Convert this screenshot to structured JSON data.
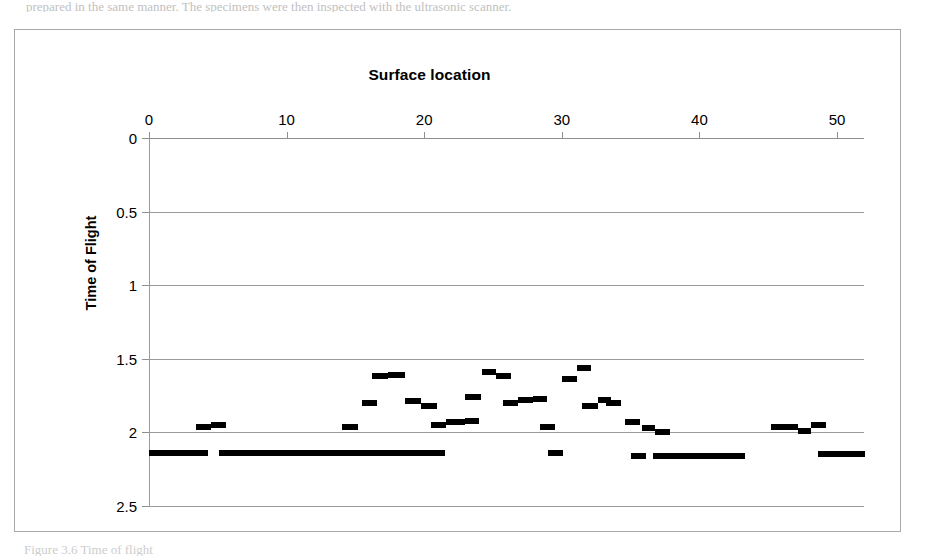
{
  "page": {
    "top_text_sliver": "prepared in the same manner. The specimens were then inspected with the ultrasonic scanner.",
    "bottom_text_sliver": "Figure 3.6  Time of flight"
  },
  "figure": {
    "title": "Surface location",
    "y_axis_title": "Time of Flight",
    "frame_color": "#a9a9a9",
    "grid_color": "#9b9b9b",
    "marker_color": "#000000"
  },
  "chart_data": {
    "type": "scatter",
    "title": "Surface location",
    "xlabel": "Surface location",
    "ylabel": "Time of Flight",
    "xlim": [
      -1,
      52
    ],
    "ylim": [
      0,
      2.5
    ],
    "y_inverted": true,
    "grid": true,
    "gridlines_horizontal": [
      0,
      0.5,
      1,
      1.5,
      2,
      2.5
    ],
    "legend": null,
    "xticks": [
      0,
      10,
      20,
      30,
      40,
      50
    ],
    "xtick_labels": [
      "0",
      "10",
      "20",
      "30",
      "40",
      "50"
    ],
    "yticks": [
      0,
      0.5,
      1,
      1.5,
      2,
      2.5
    ],
    "ytick_labels": [
      "0",
      "0.5",
      "1",
      "1.5",
      "2",
      "2.5"
    ],
    "marker_style": "horizontal-dash",
    "series": [
      {
        "name": "Time of Flight",
        "x": [
          0.3,
          1.0,
          1.7,
          2.4,
          3.1,
          3.8,
          4.4,
          5.2,
          5.9,
          6.6,
          7.3,
          8.0,
          8.7,
          9.4,
          10.1,
          10.8,
          11.5,
          12.2,
          12.9,
          13.6,
          14.3,
          15.0,
          15.7,
          16.4,
          17.1,
          17.8,
          18.5,
          19.2,
          19.9,
          20.6,
          21.3,
          14.5,
          16.7,
          17.5,
          15.9,
          18.9,
          19.8,
          20.9,
          21.7,
          22.4,
          23.5,
          24.6,
          25.4,
          26.2,
          26.9,
          27.8,
          28.6,
          29.5,
          30.4,
          31.2,
          32.0,
          32.8,
          33.6,
          35.2,
          36.4,
          37.0,
          35.6,
          36.2,
          36.8,
          37.4,
          38.0,
          38.6,
          39.2,
          39.8,
          40.4,
          41.0,
          41.6,
          42.2,
          42.8,
          45.8,
          46.6,
          47.4,
          48.2,
          48.9,
          49.6,
          50.3,
          51.0,
          51.7
        ],
        "y": [
          2.14,
          2.14,
          2.14,
          2.14,
          2.14,
          1.96,
          1.95,
          2.14,
          2.14,
          2.14,
          2.14,
          2.14,
          2.14,
          2.14,
          2.14,
          2.14,
          2.14,
          2.14,
          2.14,
          2.14,
          2.14,
          2.14,
          2.14,
          2.14,
          2.14,
          2.14,
          2.14,
          2.14,
          2.14,
          2.14,
          2.14,
          1.96,
          1.62,
          1.61,
          1.8,
          1.79,
          1.82,
          1.95,
          1.93,
          1.92,
          1.76,
          1.59,
          1.62,
          1.8,
          1.78,
          1.77,
          1.96,
          2.14,
          1.64,
          1.56,
          1.82,
          1.78,
          1.8,
          1.93,
          1.97,
          2.0,
          2.16,
          2.16,
          2.16,
          2.16,
          2.16,
          2.16,
          2.16,
          2.16,
          2.16,
          2.16,
          2.16,
          2.16,
          2.16,
          1.96,
          1.95,
          1.97,
          1.94,
          2.15,
          2.15,
          2.15,
          2.15,
          2.15
        ]
      }
    ],
    "segments": [
      {
        "x_start": 0.0,
        "x_end": 4.3,
        "y": 2.14
      },
      {
        "x_start": 3.4,
        "x_end": 4.5,
        "y": 1.96
      },
      {
        "x_start": 4.5,
        "x_end": 5.6,
        "y": 1.95
      },
      {
        "x_start": 5.1,
        "x_end": 21.5,
        "y": 2.14
      },
      {
        "x_start": 14.0,
        "x_end": 15.2,
        "y": 1.96
      },
      {
        "x_start": 16.2,
        "x_end": 17.4,
        "y": 1.62
      },
      {
        "x_start": 17.4,
        "x_end": 18.6,
        "y": 1.61
      },
      {
        "x_start": 15.5,
        "x_end": 16.6,
        "y": 1.8
      },
      {
        "x_start": 18.6,
        "x_end": 19.8,
        "y": 1.79
      },
      {
        "x_start": 19.8,
        "x_end": 20.9,
        "y": 1.82
      },
      {
        "x_start": 20.5,
        "x_end": 21.6,
        "y": 1.95
      },
      {
        "x_start": 21.6,
        "x_end": 23.0,
        "y": 1.93
      },
      {
        "x_start": 23.0,
        "x_end": 24.0,
        "y": 1.92
      },
      {
        "x_start": 23.0,
        "x_end": 24.1,
        "y": 1.76
      },
      {
        "x_start": 24.2,
        "x_end": 25.2,
        "y": 1.59
      },
      {
        "x_start": 25.2,
        "x_end": 26.3,
        "y": 1.62
      },
      {
        "x_start": 25.7,
        "x_end": 26.8,
        "y": 1.8
      },
      {
        "x_start": 26.8,
        "x_end": 27.9,
        "y": 1.78
      },
      {
        "x_start": 27.9,
        "x_end": 28.9,
        "y": 1.77
      },
      {
        "x_start": 28.4,
        "x_end": 29.5,
        "y": 1.96
      },
      {
        "x_start": 29.0,
        "x_end": 30.1,
        "y": 2.14
      },
      {
        "x_start": 30.0,
        "x_end": 31.1,
        "y": 1.64
      },
      {
        "x_start": 31.1,
        "x_end": 32.1,
        "y": 1.56
      },
      {
        "x_start": 31.5,
        "x_end": 32.6,
        "y": 1.82
      },
      {
        "x_start": 32.6,
        "x_end": 33.6,
        "y": 1.78
      },
      {
        "x_start": 33.2,
        "x_end": 34.3,
        "y": 1.8
      },
      {
        "x_start": 34.6,
        "x_end": 35.7,
        "y": 1.93
      },
      {
        "x_start": 35.8,
        "x_end": 36.8,
        "y": 1.97
      },
      {
        "x_start": 36.8,
        "x_end": 37.9,
        "y": 2.0
      },
      {
        "x_start": 35.0,
        "x_end": 36.1,
        "y": 2.16
      },
      {
        "x_start": 36.6,
        "x_end": 43.3,
        "y": 2.16
      },
      {
        "x_start": 45.2,
        "x_end": 47.2,
        "y": 1.96
      },
      {
        "x_start": 47.2,
        "x_end": 48.1,
        "y": 1.99
      },
      {
        "x_start": 48.1,
        "x_end": 49.2,
        "y": 1.95
      },
      {
        "x_start": 48.6,
        "x_end": 52.0,
        "y": 2.15
      }
    ]
  }
}
